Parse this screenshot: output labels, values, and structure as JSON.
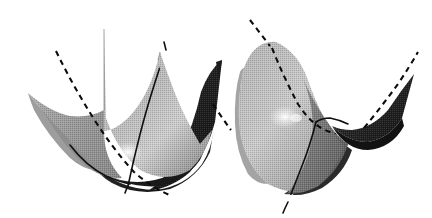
{
  "figure": {
    "title": "Quadric surfaces with coordinate curves",
    "background_color": "#ffffff",
    "width": 432,
    "height": 218,
    "render_style": "grayscale dithered halftone shading",
    "panel_count": 2
  },
  "palette": {
    "background": "#ffffff",
    "light_gray": "#d4d4d4",
    "mid_gray": "#a8a8a8",
    "shadow_gray": "#6f6f6f",
    "dark_gray": "#3a3a3a",
    "near_black": "#1c1c1c",
    "highlight_white": "#f4f4f4",
    "curve_black": "#101010",
    "silhouette_gray": "#6a6a6a"
  },
  "panels": [
    {
      "id": "left-panel",
      "name": "elliptic-paraboloid",
      "surface_type": "elliptic paraboloid",
      "description": "upward opening bowl with four cusped corners, light gray front faces and near-black right rear wing",
      "curves": [
        {
          "name": "dashed-coordinate-curve",
          "style": "dashed",
          "description": "parabola descending from upper left, through the bowl interior, exiting to the lower right"
        },
        {
          "name": "solid-coordinate-curve",
          "style": "solid",
          "description": "parabola rising steeply from the bowl floor to the upper right"
        },
        {
          "name": "solid-floor-arc",
          "style": "solid",
          "description": "short arc along the lower-left inner wall of the bowl"
        }
      ]
    },
    {
      "id": "right-panel",
      "name": "hyperbolic-paraboloid",
      "surface_type": "hyperbolic paraboloid",
      "description": "saddle surface, light gray rounded front lobe at left with a specular highlight and a dark near-black wing rising at the right",
      "curves": [
        {
          "name": "dashed-coordinate-curve",
          "style": "dashed",
          "description": "downward parabola entering at upper left, crossing the saddle valley and rising to the upper right"
        },
        {
          "name": "solid-coordinate-curve",
          "style": "solid",
          "description": "upward parabola running from the saddle ridge down through the front lobe and past the lower edge"
        }
      ]
    }
  ]
}
